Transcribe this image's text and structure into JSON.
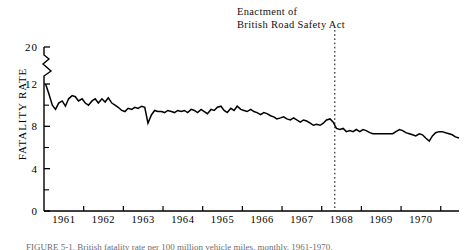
{
  "figure": {
    "annotation_line1": "Enactment of",
    "annotation_line2": "British Road Safety Act",
    "caption": "FIGURE 5-1.  British fatality rate per 100 million vehicle miles, monthly, 1961-1970.",
    "caption_prefix": "FIGURE 5-1."
  },
  "chart_data": {
    "type": "line",
    "title": "",
    "xlabel": "",
    "ylabel": "FATALITY RATE",
    "ylim": [
      0,
      20
    ],
    "xlim": [
      1960.5,
      1970.96
    ],
    "grid": false,
    "legend": "none",
    "axis_break": {
      "from": 12,
      "to": 20,
      "axis": "y"
    },
    "y_major_ticks": [
      0,
      4,
      8,
      12,
      20
    ],
    "y_minor_ticks": [
      2,
      6,
      10
    ],
    "x_tick_labels": [
      "1961",
      "1962",
      "1963",
      "1964",
      "1965",
      "1966",
      "1967",
      "1968",
      "1969",
      "1970"
    ],
    "x_tick_label_positions": [
      1961.0,
      1962.0,
      1963.0,
      1964.0,
      1965.0,
      1966.0,
      1967.0,
      1968.0,
      1969.0,
      1970.0
    ],
    "x_tick_mark_positions": [
      1961.5,
      1962.5,
      1963.5,
      1964.5,
      1965.5,
      1966.5,
      1967.5,
      1968.5,
      1969.5,
      1970.5
    ],
    "annotations": [
      {
        "label": "Enactment of British Road Safety Act",
        "type": "vertical-dashed-line",
        "x": 1967.83
      }
    ],
    "series": [
      {
        "name": "British monthly fatality rate",
        "color": "#000000",
        "x": [
          1960.54,
          1960.62,
          1960.71,
          1960.79,
          1960.87,
          1960.96,
          1961.04,
          1961.12,
          1961.21,
          1961.29,
          1961.37,
          1961.46,
          1961.54,
          1961.62,
          1961.71,
          1961.79,
          1961.87,
          1961.96,
          1962.04,
          1962.12,
          1962.21,
          1962.29,
          1962.37,
          1962.46,
          1962.54,
          1962.62,
          1962.71,
          1962.79,
          1962.87,
          1962.96,
          1963.04,
          1963.12,
          1963.21,
          1963.29,
          1963.37,
          1963.46,
          1963.54,
          1963.62,
          1963.71,
          1963.79,
          1963.87,
          1963.96,
          1964.04,
          1964.12,
          1964.21,
          1964.29,
          1964.37,
          1964.46,
          1964.54,
          1964.62,
          1964.71,
          1964.79,
          1964.87,
          1964.96,
          1965.04,
          1965.12,
          1965.21,
          1965.29,
          1965.37,
          1965.46,
          1965.54,
          1965.62,
          1965.71,
          1965.79,
          1965.87,
          1965.96,
          1966.04,
          1966.12,
          1966.21,
          1966.29,
          1966.37,
          1966.46,
          1966.54,
          1966.62,
          1966.71,
          1966.79,
          1966.87,
          1966.96,
          1967.04,
          1967.12,
          1967.21,
          1967.29,
          1967.37,
          1967.46,
          1967.54,
          1967.62,
          1967.71,
          1967.79,
          1967.87,
          1967.96,
          1968.04,
          1968.12,
          1968.21,
          1968.29,
          1968.37,
          1968.46,
          1968.54,
          1968.62,
          1968.71,
          1968.79,
          1968.87,
          1968.96,
          1969.04,
          1969.12,
          1969.21,
          1969.29,
          1969.37,
          1969.46,
          1969.54,
          1969.62,
          1969.71,
          1969.79,
          1969.87,
          1969.96,
          1970.04,
          1970.12,
          1970.21,
          1970.29,
          1970.37,
          1970.46,
          1970.54,
          1970.62,
          1970.71,
          1970.79,
          1970.87,
          1970.96
        ],
        "y": [
          12.0,
          11.1,
          10.0,
          9.6,
          10.2,
          10.4,
          9.9,
          10.6,
          10.9,
          10.8,
          10.4,
          10.6,
          10.2,
          10.0,
          10.4,
          10.6,
          10.2,
          10.6,
          10.3,
          10.7,
          10.2,
          10.0,
          9.8,
          9.5,
          9.4,
          9.7,
          9.6,
          9.8,
          9.7,
          9.9,
          9.8,
          8.3,
          9.1,
          9.5,
          9.4,
          9.4,
          9.3,
          9.5,
          9.4,
          9.3,
          9.5,
          9.4,
          9.5,
          9.3,
          9.6,
          9.5,
          9.3,
          9.6,
          9.4,
          9.2,
          9.6,
          9.5,
          9.8,
          9.9,
          9.5,
          9.3,
          9.7,
          9.5,
          9.9,
          9.6,
          9.5,
          9.4,
          9.6,
          9.4,
          9.3,
          9.1,
          9.3,
          9.2,
          9.0,
          8.9,
          8.7,
          8.8,
          8.9,
          8.7,
          8.6,
          8.8,
          8.6,
          8.4,
          8.6,
          8.5,
          8.3,
          8.1,
          8.2,
          8.1,
          8.3,
          8.6,
          8.7,
          8.4,
          7.8,
          7.7,
          7.8,
          7.5,
          7.6,
          7.5,
          7.7,
          7.5,
          7.7,
          7.6,
          7.4,
          7.3,
          7.3,
          7.3,
          7.3,
          7.3,
          7.3,
          7.3,
          7.5,
          7.7,
          7.6,
          7.4,
          7.3,
          7.2,
          7.1,
          7.3,
          7.2,
          6.9,
          6.6,
          7.1,
          7.4,
          7.5,
          7.5,
          7.4,
          7.3,
          7.2,
          7.0,
          6.9
        ]
      }
    ]
  }
}
